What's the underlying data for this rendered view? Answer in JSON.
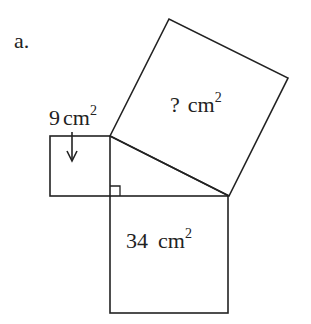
{
  "problem": {
    "label": "a."
  },
  "squares": {
    "small": {
      "value": "9",
      "unit": "cm",
      "exponent": "2"
    },
    "hypotenuse": {
      "value": "?",
      "unit": "cm",
      "exponent": "2"
    },
    "bottom": {
      "value": "34",
      "unit": "cm",
      "exponent": "2"
    }
  },
  "colors": {
    "stroke": "#222222",
    "background": "#ffffff"
  }
}
